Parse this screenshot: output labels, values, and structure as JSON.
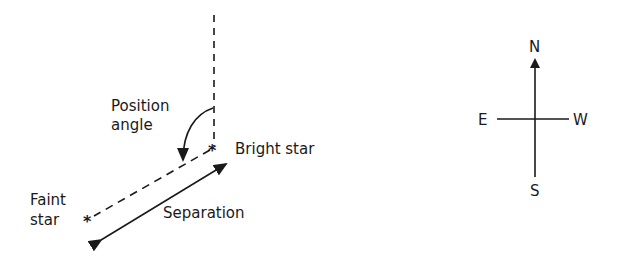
{
  "diagram": {
    "title": "",
    "labels": {
      "position_angle_line1": "Position",
      "position_angle_line2": "angle",
      "bright_star": "Bright star",
      "faint_star_line1": "Faint",
      "faint_star_line2": "star",
      "separation": "Separation"
    },
    "stars": {
      "bright_glyph": "*",
      "faint_glyph": "*"
    },
    "compass": {
      "north": "N",
      "south": "S",
      "east": "E",
      "west": "W"
    },
    "colors": {
      "ink": "#1a1a1a",
      "background": "#ffffff"
    }
  }
}
